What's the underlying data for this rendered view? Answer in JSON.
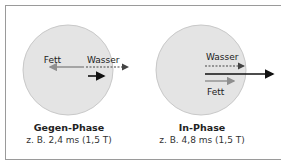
{
  "colors": {
    "circle_fill": "#e4e4e4",
    "circle_stroke": "#c8c8c8",
    "fat_arrow": "#8f8f8f",
    "water_arrow": "#444444",
    "net_arrow": "#111111",
    "frame": "#9a9a9a"
  },
  "panels": [
    {
      "id": "opposed",
      "title": "Gegen-Phase",
      "subtitle": "z. B. 2,4 ms (1,5 T)",
      "fat_label": "Fett",
      "water_label": "Wasser",
      "fat_direction": "left",
      "water_direction": "right",
      "net_vector": "short-right"
    },
    {
      "id": "in-phase",
      "title": "In-Phase",
      "subtitle": "z. B. 4,8 ms (1,5 T)",
      "fat_label": "Fett",
      "water_label": "Wasser",
      "fat_direction": "right",
      "water_direction": "right",
      "net_vector": "long-right"
    }
  ]
}
